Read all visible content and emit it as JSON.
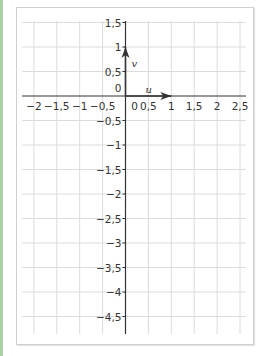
{
  "diagram": {
    "type": "coordinate-grid",
    "x_ticks": [
      "−2",
      "−1,5",
      "−1",
      "−0,5",
      "0",
      "0,5",
      "1",
      "1,5",
      "2",
      "2,5"
    ],
    "y_ticks_positive": [
      "1,5",
      "1",
      "0,5",
      "0"
    ],
    "y_ticks_negative": [
      "−0,5",
      "−1",
      "−1,5",
      "−2",
      "−2,5",
      "−3",
      "−3,5",
      "−4",
      "−4,5"
    ],
    "vectors": [
      {
        "name": "u",
        "from": [
          0,
          0
        ],
        "to": [
          1,
          0
        ]
      },
      {
        "name": "v",
        "from": [
          0,
          0
        ],
        "to": [
          0,
          1
        ]
      }
    ],
    "labels": {
      "u": "u",
      "v": "v"
    },
    "colors": {
      "grid": "#dcdcdc",
      "axis": "#333333",
      "accent_strip": "#a9d3a4",
      "frame": "#cfcfcf"
    }
  }
}
